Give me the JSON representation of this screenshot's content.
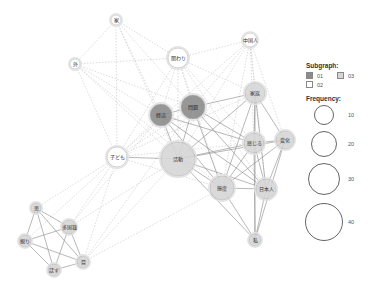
{
  "diagram": {
    "type": "co-occurrence network",
    "colors": {
      "subgraph_01": "#8c8c8c",
      "subgraph_02": "#ffffff",
      "subgraph_03": "#d6d6d6",
      "edge": "#9a9a9a",
      "edge_dashed": "#c4c4c4",
      "node_stroke": "#b5b5b5"
    },
    "nodes": [
      {
        "id": "ie",
        "label": "家",
        "x": 116,
        "y": 20,
        "r": 5,
        "group": "02"
      },
      {
        "id": "kakawari",
        "label": "関わり",
        "x": 178,
        "y": 58,
        "r": 10,
        "group": "02"
      },
      {
        "id": "chugokujin",
        "label": "中国人",
        "x": 250,
        "y": 40,
        "r": 7,
        "group": "02"
      },
      {
        "id": "soto",
        "label": "外",
        "x": 75,
        "y": 64,
        "r": 5,
        "group": "02"
      },
      {
        "id": "keizai",
        "label": "経済",
        "x": 161,
        "y": 115,
        "r": 11,
        "group": "01"
      },
      {
        "id": "mondai",
        "label": "問題",
        "x": 193,
        "y": 107,
        "r": 12,
        "group": "01"
      },
      {
        "id": "kazoku",
        "label": "家族",
        "x": 255,
        "y": 93,
        "r": 10,
        "group": "03"
      },
      {
        "id": "kodomo",
        "label": "子ども",
        "x": 117,
        "y": 157,
        "r": 10,
        "group": "02"
      },
      {
        "id": "katsudo",
        "label": "活動",
        "x": 178,
        "y": 159,
        "r": 17,
        "group": "03"
      },
      {
        "id": "kanjiru",
        "label": "感じる",
        "x": 254,
        "y": 143,
        "r": 10,
        "group": "03"
      },
      {
        "id": "henka",
        "label": "変化",
        "x": 285,
        "y": 140,
        "r": 9,
        "group": "03"
      },
      {
        "id": "taido",
        "label": "態度",
        "x": 222,
        "y": 188,
        "r": 12,
        "group": "03"
      },
      {
        "id": "nihonjin",
        "label": "日本人",
        "x": 266,
        "y": 189,
        "r": 10,
        "group": "03"
      },
      {
        "id": "watashi",
        "label": "私",
        "x": 255,
        "y": 240,
        "r": 6,
        "group": "03"
      },
      {
        "id": "omou",
        "label": "思",
        "x": 36,
        "y": 208,
        "r": 5,
        "group": "03"
      },
      {
        "id": "takokuseki",
        "label": "多国籍",
        "x": 69,
        "y": 227,
        "r": 7,
        "group": "03"
      },
      {
        "id": "shitashii",
        "label": "親り",
        "x": 25,
        "y": 241,
        "r": 6,
        "group": "03"
      },
      {
        "id": "me",
        "label": "目",
        "x": 83,
        "y": 262,
        "r": 6,
        "group": "03"
      },
      {
        "id": "hanasu",
        "label": "話す",
        "x": 54,
        "y": 270,
        "r": 6,
        "group": "03"
      }
    ],
    "edges_solid": [
      [
        "keizai",
        "mondai"
      ],
      [
        "keizai",
        "katsudo"
      ],
      [
        "mondai",
        "katsudo"
      ],
      [
        "mondai",
        "kazoku"
      ],
      [
        "mondai",
        "taido"
      ],
      [
        "keizai",
        "taido"
      ],
      [
        "keizai",
        "nihonjin"
      ],
      [
        "mondai",
        "kanjiru"
      ],
      [
        "katsudo",
        "kanjiru"
      ],
      [
        "katsudo",
        "henka"
      ],
      [
        "katsudo",
        "taido"
      ],
      [
        "katsudo",
        "nihonjin"
      ],
      [
        "katsudo",
        "kazoku"
      ],
      [
        "kazoku",
        "kanjiru"
      ],
      [
        "kazoku",
        "taido"
      ],
      [
        "kazoku",
        "nihonjin"
      ],
      [
        "kazoku",
        "henka"
      ],
      [
        "kazoku",
        "watashi"
      ],
      [
        "kanjiru",
        "henka"
      ],
      [
        "kanjiru",
        "taido"
      ],
      [
        "kanjiru",
        "nihonjin"
      ],
      [
        "kanjiru",
        "watashi"
      ],
      [
        "henka",
        "taido"
      ],
      [
        "henka",
        "nihonjin"
      ],
      [
        "henka",
        "watashi"
      ],
      [
        "taido",
        "nihonjin"
      ],
      [
        "taido",
        "watashi"
      ],
      [
        "nihonjin",
        "watashi"
      ],
      [
        "katsudo",
        "watashi"
      ],
      [
        "mondai",
        "nihonjin"
      ],
      [
        "keizai",
        "kanjiru"
      ],
      [
        "kodomo",
        "katsudo"
      ],
      [
        "omou",
        "takokuseki"
      ],
      [
        "omou",
        "shitashii"
      ],
      [
        "omou",
        "me"
      ],
      [
        "omou",
        "hanasu"
      ],
      [
        "takokuseki",
        "shitashii"
      ],
      [
        "takokuseki",
        "me"
      ],
      [
        "takokuseki",
        "hanasu"
      ],
      [
        "shitashii",
        "me"
      ],
      [
        "shitashii",
        "hanasu"
      ],
      [
        "hanasu",
        "me"
      ]
    ],
    "edges_dashed": [
      [
        "ie",
        "soto"
      ],
      [
        "ie",
        "kakawari"
      ],
      [
        "ie",
        "keizai"
      ],
      [
        "ie",
        "mondai"
      ],
      [
        "ie",
        "kodomo"
      ],
      [
        "ie",
        "katsudo"
      ],
      [
        "soto",
        "kakawari"
      ],
      [
        "soto",
        "keizai"
      ],
      [
        "soto",
        "katsudo"
      ],
      [
        "soto",
        "taido"
      ],
      [
        "soto",
        "kodomo"
      ],
      [
        "soto",
        "mondai"
      ],
      [
        "kakawari",
        "chugokujin"
      ],
      [
        "kakawari",
        "keizai"
      ],
      [
        "kakawari",
        "mondai"
      ],
      [
        "kakawari",
        "katsudo"
      ],
      [
        "kakawari",
        "kazoku"
      ],
      [
        "kakawari",
        "kanjiru"
      ],
      [
        "kakawari",
        "taido"
      ],
      [
        "kakawari",
        "kodomo"
      ],
      [
        "kakawari",
        "nihonjin"
      ],
      [
        "chugokujin",
        "kazoku"
      ],
      [
        "chugokujin",
        "mondai"
      ],
      [
        "chugokujin",
        "katsudo"
      ],
      [
        "chugokujin",
        "kanjiru"
      ],
      [
        "chugokujin",
        "henka"
      ],
      [
        "chugokujin",
        "nihonjin"
      ],
      [
        "chugokujin",
        "taido"
      ],
      [
        "chugokujin",
        "kodomo"
      ],
      [
        "kodomo",
        "keizai"
      ],
      [
        "kodomo",
        "mondai"
      ],
      [
        "kodomo",
        "taido"
      ],
      [
        "kodomo",
        "kazoku"
      ],
      [
        "kodomo",
        "kanjiru"
      ],
      [
        "kodomo",
        "omou"
      ],
      [
        "kodomo",
        "takokuseki"
      ],
      [
        "kodomo",
        "shitashii"
      ],
      [
        "kodomo",
        "me"
      ],
      [
        "katsudo",
        "takokuseki"
      ],
      [
        "katsudo",
        "me"
      ],
      [
        "keizai",
        "takokuseki"
      ],
      [
        "mondai",
        "me"
      ],
      [
        "taido",
        "me"
      ]
    ]
  },
  "legend": {
    "subgraph_title": "Subgraph:",
    "subgraph_items": [
      {
        "label": "01",
        "color": "#8c8c8c"
      },
      {
        "label": "03",
        "color": "#d6d6d6"
      },
      {
        "label": "02",
        "color": "#ffffff"
      }
    ],
    "frequency_title": "Frequency:",
    "frequency_items": [
      {
        "label": "10",
        "d": 20
      },
      {
        "label": "20",
        "d": 26
      },
      {
        "label": "30",
        "d": 32
      },
      {
        "label": "40",
        "d": 38
      }
    ]
  }
}
